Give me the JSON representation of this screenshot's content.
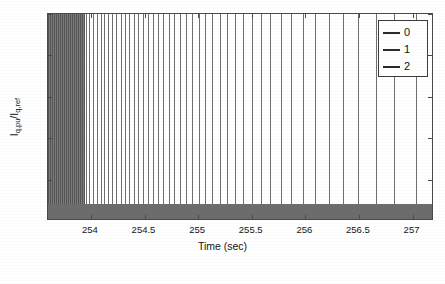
{
  "chart_data": {
    "type": "line",
    "title": "",
    "xlabel": "Time (sec)",
    "ylabel": "Iq,pu/Iq,ref",
    "ylabel_parts": {
      "base1": "I",
      "sub1": "q,pu",
      "separator": "/I",
      "sub2": "q,ref"
    },
    "xlim": [
      253.6,
      257.2
    ],
    "ylim": [
      0,
      0.5
    ],
    "xticks": [
      254,
      254.5,
      255,
      255.5,
      256,
      256.5,
      257
    ],
    "xtick_labels": [
      "254",
      "254.5",
      "255",
      "255.5",
      "256",
      "256.5",
      "257"
    ],
    "yticks": [
      0,
      0.1,
      0.2,
      0.3,
      0.4,
      0.5
    ],
    "ytick_labels": [
      "0",
      "0.1",
      "0.2",
      "0.3",
      "0.4",
      "0.5"
    ],
    "grid": false,
    "legend_position": "upper-right",
    "legend": [
      {
        "label": "0",
        "color": "#2b2b2b"
      },
      {
        "label": "1",
        "color": "#2b2b2b"
      },
      {
        "label": "2",
        "color": "#2b2b2b"
      }
    ],
    "baseline_band": {
      "description": "solid filled region near zero spanning full x-range",
      "y_min": 0,
      "y_max": 0.042,
      "color": "#6c6c6c"
    },
    "dense_block": {
      "description": "saturated dense oscillation region at left of plot",
      "x_start": 253.6,
      "x_end": 253.94,
      "y_min": 0,
      "y_max": 0.5,
      "color": "#7a7a7a"
    },
    "series": [
      {
        "name": "0",
        "description": "rapid oscillation spikes from 0 to 0.5 with progressively increasing period",
        "color": "#6f6f6f",
        "spike_x": [
          253.95,
          253.985,
          254.02,
          254.055,
          254.09,
          254.125,
          254.162,
          254.2,
          254.238,
          254.277,
          254.317,
          254.358,
          254.4,
          254.443,
          254.487,
          254.532,
          254.578,
          254.626,
          254.675,
          254.726,
          254.778,
          254.832,
          254.888,
          254.946,
          255.006,
          255.068,
          255.133,
          255.2,
          255.27,
          255.343,
          255.42,
          255.5,
          255.585,
          255.675,
          255.77,
          255.87,
          255.978,
          256.093,
          256.217,
          256.35,
          256.495,
          256.655,
          256.83,
          257.03
        ],
        "spike_y_max": 0.5,
        "spike_y_min": 0
      }
    ],
    "annotations": []
  },
  "figure": {
    "background": "#ffffff",
    "axis_color": "#4a4a4a",
    "text_color": "#141414"
  }
}
